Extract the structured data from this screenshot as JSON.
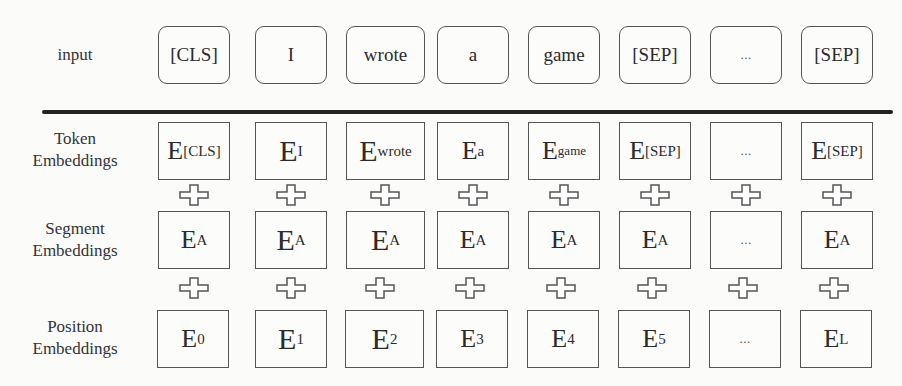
{
  "figure": {
    "type": "bert-input-representation",
    "rows": {
      "input": {
        "label": "input",
        "tokens": [
          "[CLS]",
          "I",
          "wrote",
          "a",
          "game",
          "[SEP]",
          "...",
          "[SEP]"
        ]
      },
      "token_embeddings": {
        "label_line1": "Token",
        "label_line2": "Embeddings",
        "cells": [
          {
            "base": "E",
            "sub": "[CLS]"
          },
          {
            "base": "E",
            "sub": "I"
          },
          {
            "base": "E",
            "sub": "wrote"
          },
          {
            "base": "E",
            "sub": "a"
          },
          {
            "base": "E",
            "sub": "game"
          },
          {
            "base": "E",
            "sub": "[SEP]"
          },
          {
            "base": "",
            "sub": "..."
          },
          {
            "base": "E",
            "sub": "[SEP]"
          }
        ]
      },
      "segment_embeddings": {
        "label_line1": "Segment",
        "label_line2": "Embeddings",
        "cells": [
          {
            "base": "E",
            "sub": "A"
          },
          {
            "base": "E",
            "sub": "A"
          },
          {
            "base": "E",
            "sub": "A"
          },
          {
            "base": "E",
            "sub": "A"
          },
          {
            "base": "E",
            "sub": "A"
          },
          {
            "base": "E",
            "sub": "A"
          },
          {
            "base": "",
            "sub": "..."
          },
          {
            "base": "E",
            "sub": "A"
          }
        ]
      },
      "position_embeddings": {
        "label_line1": "Position",
        "label_line2": "Embeddings",
        "cells": [
          {
            "base": "E",
            "sub": "0"
          },
          {
            "base": "E",
            "sub": "1"
          },
          {
            "base": "E",
            "sub": "2"
          },
          {
            "base": "E",
            "sub": "3"
          },
          {
            "base": "E",
            "sub": "4"
          },
          {
            "base": "E",
            "sub": "5"
          },
          {
            "base": "",
            "sub": "..."
          },
          {
            "base": "E",
            "sub": "L"
          }
        ]
      }
    },
    "operator_icon": "plus-icon",
    "colors": {
      "background": "#fbfbf9",
      "stroke": "#555555",
      "divider": "#222222",
      "text": "#2b2b2b"
    }
  }
}
